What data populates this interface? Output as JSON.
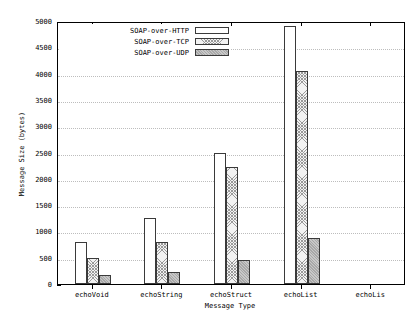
{
  "chart_data": {
    "type": "bar",
    "title": "",
    "xlabel": "Message Type",
    "ylabel": "Message Size (bytes)",
    "categories": [
      "echoVoid",
      "echoString",
      "echoStruct",
      "echoList",
      "echoLis"
    ],
    "series": [
      {
        "name": "SOAP-over-HTTP",
        "fill": "open",
        "values": [
          800,
          1250,
          2500,
          4900,
          null
        ]
      },
      {
        "name": "SOAP-over-TCP",
        "fill": "check",
        "values": [
          500,
          800,
          2230,
          4050,
          null
        ]
      },
      {
        "name": "SOAP-over-UDP",
        "fill": "solid",
        "values": [
          180,
          230,
          460,
          880,
          null
        ]
      }
    ],
    "ylim": [
      0,
      5000
    ],
    "yticks": [
      0,
      500,
      1000,
      1500,
      2000,
      2500,
      3000,
      3500,
      4000,
      4500,
      5000
    ],
    "ytick_labels": [
      "0",
      "500",
      "1000",
      "1500",
      "2000",
      "2500",
      "3000",
      "3500",
      "4000",
      "4500",
      "5000"
    ],
    "grid": true,
    "grid_style": "dotted-horizontal",
    "legend_position": "top-left-inside"
  },
  "legend": {
    "items": [
      {
        "label": "SOAP-over-HTTP",
        "swatch": "open-rectangle-swatch"
      },
      {
        "label": "SOAP-over-TCP",
        "swatch": "checkered-rectangle-swatch"
      },
      {
        "label": "SOAP-over-UDP",
        "swatch": "solid-gray-rectangle-swatch"
      }
    ]
  },
  "axes": {
    "x_title": "Message Type",
    "y_title": "Message Size (bytes)"
  }
}
